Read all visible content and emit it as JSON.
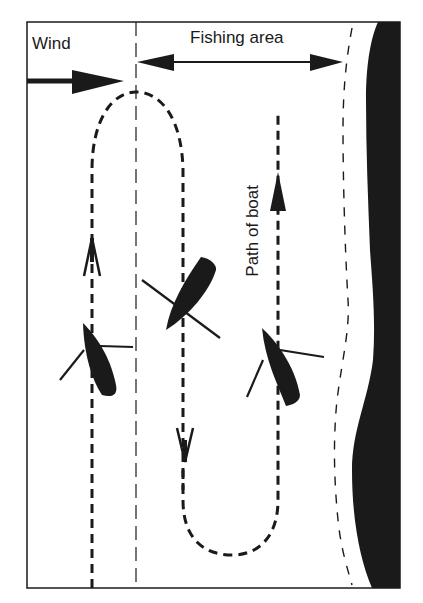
{
  "labels": {
    "wind": "Wind",
    "fishing_area": "Fishing area",
    "path_of_boat": "Path of boat"
  },
  "colors": {
    "ink": "#1a1a1a",
    "background": "#ffffff"
  },
  "elements": {
    "frame": "rectangular border",
    "wind_arrow": "arrow pointing right",
    "fishing_area_arrow": "double-headed arrow",
    "boat_path": "dashed looping path",
    "boats": [
      "boat-upwind-left",
      "boat-center",
      "boat-right"
    ],
    "shore": "black landmass on right edge",
    "shoreline_boundary": "dashed curved line"
  }
}
